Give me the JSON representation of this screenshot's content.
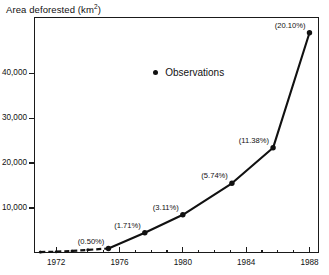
{
  "chart_data": {
    "type": "line",
    "title": "Area deforested (km",
    "title_sup": "2",
    "title_suffix": ")",
    "ylabel": "Area deforested (km^2)",
    "xlabel": "",
    "xlim": [
      1970.6,
      1988.6
    ],
    "ylim": [
      0,
      52500
    ],
    "grid": false,
    "legend_position": "top-center",
    "legend": [
      {
        "name": "Observations",
        "marker": "filled-circle",
        "color": "#111111"
      }
    ],
    "yticks": [
      10000,
      20000,
      30000,
      40000
    ],
    "ytick_labels": [
      "10,000",
      "20,000",
      "30,000",
      "40,000"
    ],
    "xticks": [
      1972,
      1976,
      1980,
      1984,
      1988
    ],
    "xtick_labels": [
      "1972",
      "1976",
      "1980",
      "1984",
      "1988"
    ],
    "xminor_ticks": [
      1973,
      1974,
      1975,
      1977,
      1978,
      1979,
      1981,
      1982,
      1983,
      1985,
      1986,
      1987
    ],
    "series": [
      {
        "name": "Observations",
        "style": "dashed",
        "x": [
          1971.0,
          1972.0,
          1973.0,
          1974.0,
          1975.3
        ],
        "values": [
          200,
          300,
          450,
          700,
          1000
        ]
      },
      {
        "name": "Observations",
        "style": "solid",
        "x": [
          1975.3,
          1977.6,
          1980.0,
          1983.1,
          1985.7,
          1988.0
        ],
        "values": [
          1000,
          4500,
          8500,
          15500,
          23400,
          49000
        ]
      }
    ],
    "annotations": [
      {
        "text": "(0.50%)",
        "x": 1975.3,
        "value": 1000,
        "anchor": "above-left"
      },
      {
        "text": "(1.71%)",
        "x": 1977.6,
        "value": 4500,
        "anchor": "above-left"
      },
      {
        "text": "(3.11%)",
        "x": 1980.0,
        "value": 8500,
        "anchor": "above-left"
      },
      {
        "text": "(5.74%)",
        "x": 1983.1,
        "value": 15500,
        "anchor": "above-left"
      },
      {
        "text": "(11.38%)",
        "x": 1985.7,
        "value": 23400,
        "anchor": "above-left"
      },
      {
        "text": "(20.10%)",
        "x": 1988.0,
        "value": 49000,
        "anchor": "above-left"
      }
    ],
    "colors": {
      "line": "#111111",
      "marker": "#111111",
      "axis": "#1a1a1a",
      "background": "#ffffff"
    }
  },
  "legend_text": {
    "observations": "Observations"
  }
}
